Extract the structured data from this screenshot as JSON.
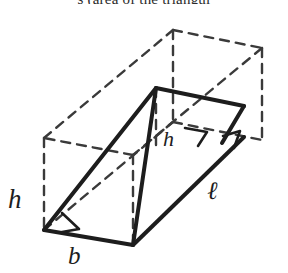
{
  "caption": {
    "fragment": "s (area of the triangul"
  },
  "figure": {
    "colors": {
      "solid_line": "#1d1d1d",
      "dashed_line": "#3a3a3a",
      "background": "#ffffff",
      "label_text": "#1d1d1d"
    },
    "labels": {
      "height_left": "h",
      "height_apex": "h",
      "base": "b",
      "length": "ℓ"
    },
    "right_angle_markers": 3
  }
}
